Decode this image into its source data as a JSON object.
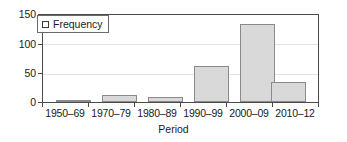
{
  "chart_data": {
    "type": "bar",
    "title": "",
    "subtitle": "",
    "xlabel": "Period",
    "ylabel": "",
    "categories": [
      "1950–69",
      "1970–79",
      "1980–89",
      "1990–99",
      "2000–09",
      "2010–12"
    ],
    "values": [
      3,
      12,
      8,
      62,
      134,
      35
    ],
    "series": [
      {
        "name": "Frequency",
        "values": [
          3,
          12,
          8,
          62,
          134,
          35
        ]
      }
    ],
    "ylim": [
      0,
      150
    ],
    "yticks": [
      0,
      50,
      100,
      150
    ],
    "ytick_labels": [
      "0",
      "50",
      "100",
      "150"
    ],
    "grid": "horizontal",
    "legend_position": "top-left",
    "legend_entries": [
      "Frequency"
    ],
    "bar_fill_color": "#d9d9d9",
    "bar_border_color": "#8a8a8a",
    "gridline_color": "#e2e2e2",
    "axis_color": "#4a4a4a"
  },
  "legend": {
    "label": "Frequency",
    "swatch_icon": "square-outline-icon"
  },
  "axes": {
    "x_title": "Period",
    "y_title": ""
  }
}
